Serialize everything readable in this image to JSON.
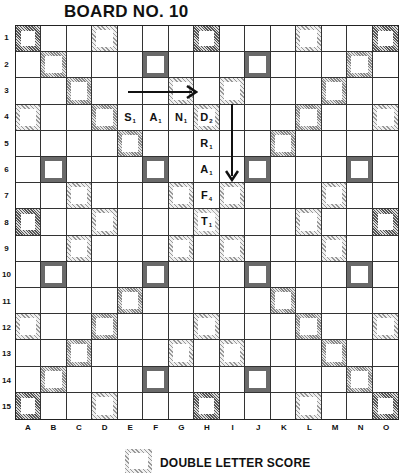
{
  "title": "BOARD NO. 10",
  "row_labels": [
    "1",
    "2",
    "3",
    "4",
    "5",
    "6",
    "7",
    "8",
    "9",
    "10",
    "11",
    "12",
    "13",
    "14",
    "15"
  ],
  "col_labels": [
    "A",
    "B",
    "C",
    "D",
    "E",
    "F",
    "G",
    "H",
    "I",
    "J",
    "K",
    "L",
    "M",
    "N",
    "O"
  ],
  "premium_layout": [
    "TW..DL...TW...DL..TW",
    "placeholder"
  ],
  "premium_rows": [
    [
      "TW",
      "",
      "",
      "DL",
      "",
      "",
      "",
      "TW",
      "",
      "",
      "",
      "DL",
      "",
      "",
      "TW"
    ],
    [
      "",
      "DW",
      "",
      "",
      "",
      "TL",
      "",
      "",
      "",
      "TL",
      "",
      "",
      "",
      "DW",
      ""
    ],
    [
      "",
      "",
      "DW",
      "",
      "",
      "",
      "DL",
      "",
      "DL",
      "",
      "",
      "",
      "DW",
      "",
      ""
    ],
    [
      "DL",
      "",
      "",
      "DW",
      "",
      "",
      "",
      "DL",
      "",
      "",
      "",
      "DW",
      "",
      "",
      "DL"
    ],
    [
      "",
      "",
      "",
      "",
      "DW",
      "",
      "",
      "",
      "",
      "",
      "DW",
      "",
      "",
      "",
      ""
    ],
    [
      "",
      "TL",
      "",
      "",
      "",
      "TL",
      "",
      "",
      "",
      "TL",
      "",
      "",
      "",
      "TL",
      ""
    ],
    [
      "",
      "",
      "DL",
      "",
      "",
      "",
      "DL",
      "",
      "DL",
      "",
      "",
      "",
      "DL",
      "",
      ""
    ],
    [
      "TW",
      "",
      "",
      "DL",
      "",
      "",
      "",
      "ST",
      "",
      "",
      "",
      "DL",
      "",
      "",
      "TW"
    ],
    [
      "",
      "",
      "DL",
      "",
      "",
      "",
      "DL",
      "",
      "DL",
      "",
      "",
      "",
      "DL",
      "",
      ""
    ],
    [
      "",
      "TL",
      "",
      "",
      "",
      "TL",
      "",
      "",
      "",
      "TL",
      "",
      "",
      "",
      "TL",
      ""
    ],
    [
      "",
      "",
      "",
      "",
      "DW",
      "",
      "",
      "",
      "",
      "",
      "DW",
      "",
      "",
      "",
      ""
    ],
    [
      "DL",
      "",
      "",
      "DW",
      "",
      "",
      "",
      "DL",
      "",
      "",
      "",
      "DW",
      "",
      "",
      "DL"
    ],
    [
      "",
      "",
      "DW",
      "",
      "",
      "",
      "DL",
      "",
      "DL",
      "",
      "",
      "",
      "DW",
      "",
      ""
    ],
    [
      "",
      "DW",
      "",
      "",
      "",
      "TL",
      "",
      "",
      "",
      "TL",
      "",
      "",
      "",
      "DW",
      ""
    ],
    [
      "TW",
      "",
      "",
      "DL",
      "",
      "",
      "",
      "TW",
      "",
      "",
      "",
      "DL",
      "",
      "",
      "TW"
    ]
  ],
  "tiles": [
    {
      "row": 4,
      "col": "E",
      "letter": "S",
      "value": "1"
    },
    {
      "row": 4,
      "col": "F",
      "letter": "A",
      "value": "1"
    },
    {
      "row": 4,
      "col": "G",
      "letter": "N",
      "value": "1"
    },
    {
      "row": 4,
      "col": "H",
      "letter": "D",
      "value": "2"
    },
    {
      "row": 5,
      "col": "H",
      "letter": "R",
      "value": "1"
    },
    {
      "row": 6,
      "col": "H",
      "letter": "A",
      "value": "1"
    },
    {
      "row": 7,
      "col": "H",
      "letter": "F",
      "value": "4"
    },
    {
      "row": 8,
      "col": "H",
      "letter": "T",
      "value": "1"
    }
  ],
  "arrows": [
    {
      "direction": "right",
      "row": 3,
      "from_col": "E",
      "to_col": "H"
    },
    {
      "direction": "down",
      "col": "I",
      "from_row": 4,
      "to_row": 7
    }
  ],
  "legend": {
    "label": "DOUBLE LETTER SCORE"
  }
}
